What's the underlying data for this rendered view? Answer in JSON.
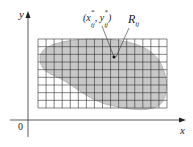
{
  "axes": {
    "x_label": "x",
    "y_label": "y",
    "origin_label": "0"
  },
  "point_label": {
    "text": "(x*ij, y*ij)",
    "x": "x",
    "y": "y",
    "sup": "*",
    "sub": "ij"
  },
  "region_label": {
    "main": "R",
    "sub": "ij"
  },
  "grid": {
    "columns": 16,
    "rows": 9
  },
  "colors": {
    "region_fill": "#c8c8c8",
    "grid_line": "#333333",
    "axis": "#333333"
  }
}
